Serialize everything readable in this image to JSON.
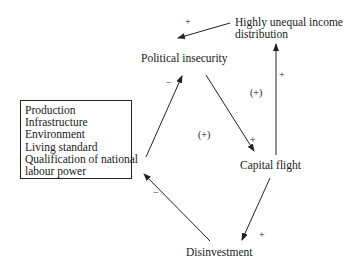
{
  "diagram": {
    "nodes": {
      "income": {
        "line1": "Highly unequal income",
        "line2": "distribution"
      },
      "political": "Political insecurity",
      "capital": "Capital flight",
      "disinvestment": "Disinvestment",
      "box": [
        "Production",
        "Infrastructure",
        "Environment",
        "Living standard",
        "Qualification of national",
        "labour power"
      ]
    },
    "edges": [
      {
        "from": "Highly unequal income distribution",
        "to": "Political insecurity",
        "sign": "+"
      },
      {
        "from": "Political insecurity",
        "to": "Capital flight",
        "sign": "+"
      },
      {
        "from": "Capital flight",
        "to": "Highly unequal income distribution",
        "sign": "+"
      },
      {
        "from": "Capital flight",
        "to": "Disinvestment",
        "sign": "+"
      },
      {
        "from": "Disinvestment",
        "to": "Production / Infrastructure / ...",
        "sign": "−"
      },
      {
        "from": "Production / Infrastructure / ...",
        "to": "Political insecurity",
        "sign": "−"
      }
    ],
    "loop_labels": {
      "upper_right": "(+)",
      "center": "(+)"
    },
    "signs": {
      "top": "+",
      "left_up": "−",
      "diag_down": "+",
      "vertical": "+",
      "lower_right": "+",
      "lower_left": "−"
    },
    "line_color": "#222222"
  }
}
